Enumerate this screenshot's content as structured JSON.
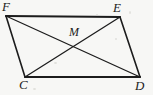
{
  "figure": {
    "name": "parallelogram-with-diagonals",
    "background_color": "#f7f7f5",
    "stroke_color": "#1c1c1c",
    "labels": {
      "F": "F",
      "E": "E",
      "C": "C",
      "D": "D",
      "M": "M"
    },
    "vertices": {
      "F": {
        "x": 6,
        "y": 16
      },
      "E": {
        "x": 120,
        "y": 17
      },
      "C": {
        "x": 25,
        "y": 77
      },
      "D": {
        "x": 140,
        "y": 77
      },
      "M": {
        "x": 74,
        "y": 47
      }
    },
    "edges": [
      {
        "name": "side-FE",
        "from": "F",
        "to": "E",
        "width": 2.2
      },
      {
        "name": "side-ED",
        "from": "E",
        "to": "D",
        "width": 1.6
      },
      {
        "name": "side-DC",
        "from": "D",
        "to": "C",
        "width": 2.2
      },
      {
        "name": "side-CF",
        "from": "C",
        "to": "F",
        "width": 1.6
      }
    ],
    "diagonals": [
      {
        "name": "diagonal-FD",
        "from": "F",
        "to": "D",
        "width": 1.3
      },
      {
        "name": "diagonal-CE",
        "from": "C",
        "to": "E",
        "width": 1.3
      }
    ]
  }
}
